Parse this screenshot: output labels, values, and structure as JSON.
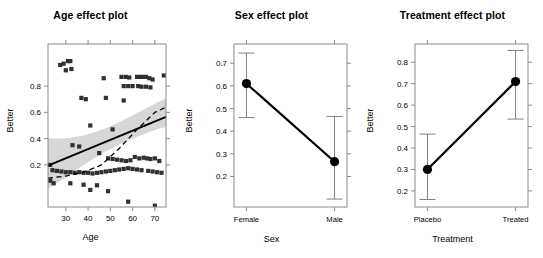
{
  "figure": {
    "background": "#ffffff",
    "panel_count": 3,
    "response_label": "Better"
  },
  "chart_data": [
    {
      "type": "scatter",
      "title": "Age effect plot",
      "xlabel": "Age",
      "ylabel": "Better",
      "xlim": [
        22,
        75
      ],
      "ylim": [
        -0.12,
        1.12
      ],
      "xticks": [
        30,
        40,
        50,
        60,
        70
      ],
      "yticks": [
        0.2,
        0.4,
        0.6,
        0.8
      ],
      "xticklabels": [
        "30",
        "40",
        "50",
        "60",
        "70"
      ],
      "yticklabels": [
        "0.8",
        "0.6",
        "0.4",
        "0.2"
      ],
      "grid": false,
      "legend": null,
      "marker": "square",
      "marker_color": "#303030",
      "fit_line": {
        "style": "solid",
        "color": "#000000",
        "x": [
          22,
          75
        ],
        "y": [
          0.195,
          0.565
        ],
        "label": "linear effect fit"
      },
      "smooth_line": {
        "style": "dashed",
        "color": "#000000",
        "x": [
          22,
          30,
          38,
          46,
          54,
          62,
          70,
          75
        ],
        "y": [
          0.1,
          0.115,
          0.145,
          0.2,
          0.325,
          0.47,
          0.6,
          0.64
        ],
        "label": "loess smooth"
      },
      "confidence_band": {
        "color": "#c9c9c9",
        "opacity": 0.75,
        "label": "95% pointwise confidence band",
        "x": [
          22,
          30,
          38,
          46,
          54,
          62,
          70,
          75
        ],
        "upper": [
          0.4,
          0.4,
          0.425,
          0.465,
          0.525,
          0.595,
          0.665,
          0.705
        ],
        "lower": [
          0.02,
          0.105,
          0.2,
          0.285,
          0.355,
          0.415,
          0.465,
          0.49
        ]
      },
      "points": [
        {
          "x": 29,
          "y": 0.97
        },
        {
          "x": 31,
          "y": 0.99
        },
        {
          "x": 32,
          "y": 0.99
        },
        {
          "x": 32.5,
          "y": 0.93
        },
        {
          "x": 30,
          "y": 0.92
        },
        {
          "x": 27.5,
          "y": 0.96
        },
        {
          "x": 47,
          "y": 0.86
        },
        {
          "x": 55,
          "y": 0.87
        },
        {
          "x": 57,
          "y": 0.87
        },
        {
          "x": 58.5,
          "y": 0.865
        },
        {
          "x": 63,
          "y": 0.87
        },
        {
          "x": 64.5,
          "y": 0.87
        },
        {
          "x": 66,
          "y": 0.87
        },
        {
          "x": 67.5,
          "y": 0.86
        },
        {
          "x": 69,
          "y": 0.85
        },
        {
          "x": 74,
          "y": 0.88
        },
        {
          "x": 56,
          "y": 0.8
        },
        {
          "x": 58,
          "y": 0.8
        },
        {
          "x": 60,
          "y": 0.8
        },
        {
          "x": 62.5,
          "y": 0.8
        },
        {
          "x": 64,
          "y": 0.795
        },
        {
          "x": 66,
          "y": 0.795
        },
        {
          "x": 68,
          "y": 0.79
        },
        {
          "x": 37,
          "y": 0.71
        },
        {
          "x": 39,
          "y": 0.7
        },
        {
          "x": 48,
          "y": 0.71
        },
        {
          "x": 56,
          "y": 0.69
        },
        {
          "x": 41,
          "y": 0.5
        },
        {
          "x": 51,
          "y": 0.47
        },
        {
          "x": 33,
          "y": 0.35
        },
        {
          "x": 36,
          "y": 0.34
        },
        {
          "x": 45,
          "y": 0.29
        },
        {
          "x": 49,
          "y": 0.25
        },
        {
          "x": 51,
          "y": 0.245
        },
        {
          "x": 53,
          "y": 0.24
        },
        {
          "x": 55,
          "y": 0.235
        },
        {
          "x": 57,
          "y": 0.23
        },
        {
          "x": 59,
          "y": 0.235
        },
        {
          "x": 61,
          "y": 0.26
        },
        {
          "x": 63,
          "y": 0.25
        },
        {
          "x": 65,
          "y": 0.255
        },
        {
          "x": 66.5,
          "y": 0.25
        },
        {
          "x": 68,
          "y": 0.245
        },
        {
          "x": 70,
          "y": 0.25
        },
        {
          "x": 72,
          "y": 0.23
        },
        {
          "x": 23,
          "y": 0.2
        },
        {
          "x": 24,
          "y": 0.16
        },
        {
          "x": 26,
          "y": 0.155
        },
        {
          "x": 28,
          "y": 0.15
        },
        {
          "x": 30,
          "y": 0.145
        },
        {
          "x": 32,
          "y": 0.145
        },
        {
          "x": 34,
          "y": 0.14
        },
        {
          "x": 36,
          "y": 0.145
        },
        {
          "x": 38,
          "y": 0.14
        },
        {
          "x": 40,
          "y": 0.14
        },
        {
          "x": 42,
          "y": 0.135
        },
        {
          "x": 44,
          "y": 0.14
        },
        {
          "x": 46,
          "y": 0.145
        },
        {
          "x": 48,
          "y": 0.15
        },
        {
          "x": 50,
          "y": 0.155
        },
        {
          "x": 52,
          "y": 0.16
        },
        {
          "x": 54,
          "y": 0.165
        },
        {
          "x": 56,
          "y": 0.17
        },
        {
          "x": 58,
          "y": 0.175
        },
        {
          "x": 60,
          "y": 0.17
        },
        {
          "x": 62,
          "y": 0.165
        },
        {
          "x": 64,
          "y": 0.16
        },
        {
          "x": 67,
          "y": 0.155
        },
        {
          "x": 69,
          "y": 0.15
        },
        {
          "x": 71,
          "y": 0.145
        },
        {
          "x": 73,
          "y": 0.14
        },
        {
          "x": 23,
          "y": 0.08
        },
        {
          "x": 24.5,
          "y": 0.06
        },
        {
          "x": 32,
          "y": 0.06
        },
        {
          "x": 38,
          "y": 0.05
        },
        {
          "x": 44,
          "y": 0.045
        },
        {
          "x": 41,
          "y": 0.01
        },
        {
          "x": 49,
          "y": 0.0
        },
        {
          "x": 58,
          "y": -0.08
        },
        {
          "x": 70,
          "y": -0.11
        },
        {
          "x": 62,
          "y": 0.87
        }
      ]
    },
    {
      "type": "line",
      "title": "Sex effect plot",
      "xlabel": "Sex",
      "ylabel": "Better",
      "categories": [
        "Female",
        "Male"
      ],
      "values": [
        0.61,
        0.265
      ],
      "errors_lower": [
        0.46,
        0.1
      ],
      "errors_upper": [
        0.745,
        0.465
      ],
      "yticks": [
        0.2,
        0.3,
        0.4,
        0.5,
        0.6,
        0.7
      ],
      "yticklabels": [
        "0.7",
        "0.6",
        "0.5",
        "0.4",
        "0.3",
        "0.2"
      ],
      "ylim": [
        0.065,
        0.785
      ],
      "grid": false,
      "legend": null,
      "marker": "circle",
      "marker_color": "#000000",
      "errorbar_color": "#808080"
    },
    {
      "type": "line",
      "title": "Treatment effect plot",
      "xlabel": "Treatment",
      "ylabel": "Better",
      "categories": [
        "Placebo",
        "Treated"
      ],
      "values": [
        0.3,
        0.71
      ],
      "errors_lower": [
        0.16,
        0.535
      ],
      "errors_upper": [
        0.465,
        0.855
      ],
      "yticks": [
        0.2,
        0.3,
        0.4,
        0.5,
        0.6,
        0.7,
        0.8
      ],
      "yticklabels": [
        "0.8",
        "0.7",
        "0.6",
        "0.5",
        "0.4",
        "0.3",
        "0.2"
      ],
      "ylim": [
        0.125,
        0.885
      ],
      "grid": false,
      "legend": null,
      "marker": "circle",
      "marker_color": "#000000",
      "errorbar_color": "#808080"
    }
  ]
}
